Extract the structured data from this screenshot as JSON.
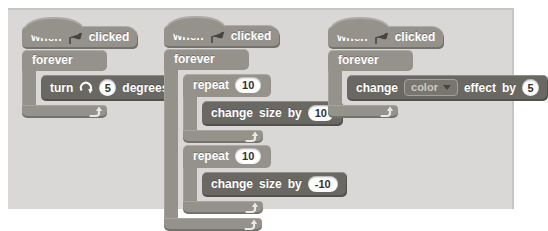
{
  "colors": {
    "page_bg": "#ffffff",
    "panel_bg": "#d9d8d6",
    "panel_edge": "#c6c5c3",
    "control_block": "#95928b",
    "command_block": "#6a6862",
    "block_text": "#ffffff",
    "value_bg": "#ffffff",
    "value_text": "#33322f",
    "dropdown_bg": "#78766f",
    "dropdown_border": "#a3a19a",
    "dropdown_text": "#ccc9c2",
    "icon_dark": "#45443f",
    "loop_arrow": "#e9e8e5"
  },
  "icons": {
    "flag": "green-flag-icon",
    "rotate": "rotate-clockwise-icon",
    "loop": "loop-arrow-icon",
    "dropdown": "dropdown-arrow-icon"
  },
  "stack1": {
    "hat": {
      "when": "when",
      "clicked": "clicked"
    },
    "forever_label": "forever",
    "turn": {
      "verb": "turn",
      "value": "5",
      "unit": "degrees"
    }
  },
  "stack2": {
    "hat": {
      "when": "when",
      "clicked": "clicked"
    },
    "forever_label": "forever",
    "repeat1": {
      "label": "repeat",
      "count": "10",
      "change": {
        "verb": "change",
        "noun": "size",
        "prep": "by",
        "value": "10"
      }
    },
    "repeat2": {
      "label": "repeat",
      "count": "10",
      "change": {
        "verb": "change",
        "noun": "size",
        "prep": "by",
        "value": "-10"
      }
    }
  },
  "stack3": {
    "hat": {
      "when": "when",
      "clicked": "clicked"
    },
    "forever_label": "forever",
    "change_effect": {
      "verb": "change",
      "dropdown_value": "color",
      "noun": "effect",
      "prep": "by",
      "value": "5"
    }
  }
}
